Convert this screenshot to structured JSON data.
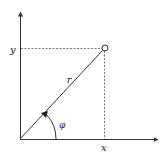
{
  "diagram": {
    "type": "polar-coordinates",
    "labels": {
      "x_axis": "x",
      "y_axis": "y",
      "radius": "r",
      "angle": "φ"
    },
    "colors": {
      "line": "#333333",
      "background": "#ffffff"
    }
  }
}
